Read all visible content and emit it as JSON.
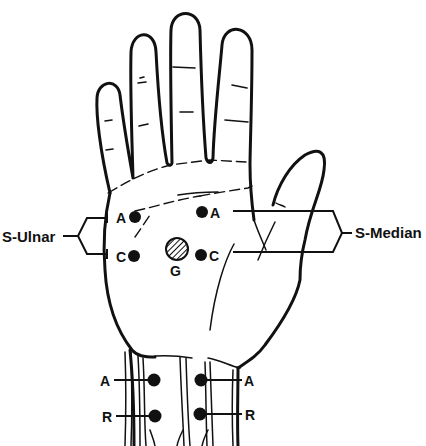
{
  "diagram": {
    "title": "",
    "groups": {
      "ulnar": {
        "label": "S-Ulnar",
        "points": [
          "A",
          "C"
        ]
      },
      "median": {
        "label": "S-Median",
        "points": [
          "A",
          "C"
        ]
      },
      "ground": {
        "label": "G"
      },
      "wrist_left": {
        "points": [
          "A",
          "R"
        ]
      },
      "wrist_right": {
        "points": [
          "A",
          "R"
        ]
      }
    },
    "colors": {
      "ink": "#111111",
      "background": "#ffffff"
    }
  }
}
